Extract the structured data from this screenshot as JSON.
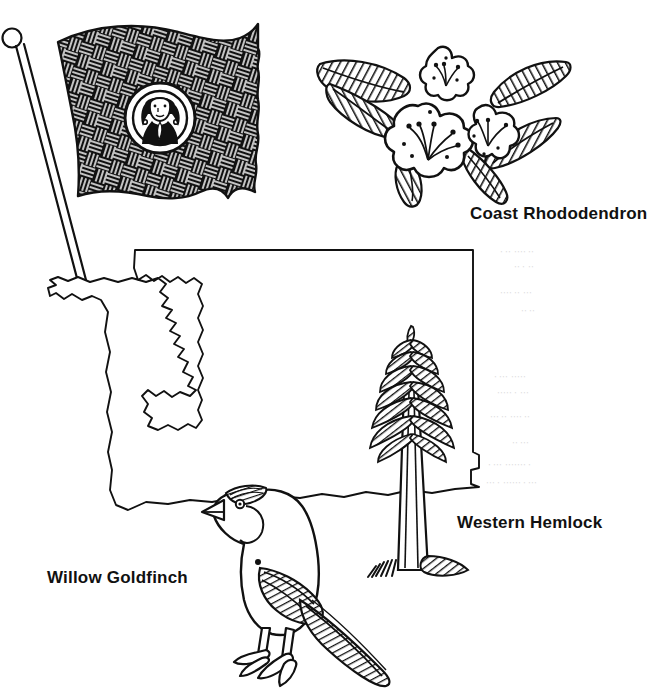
{
  "page": {
    "background_color": "#ffffff",
    "ink_color": "#111111",
    "width": 640,
    "height": 699,
    "style": "black-and-white line art / coloring book page"
  },
  "labels": {
    "rhododendron": "Coast Rhododendron",
    "hemlock": "Western Hemlock",
    "goldfinch": "Willow Goldfinch"
  },
  "illustrations": [
    {
      "name": "state-flag",
      "description": "Waving state flag on a pole with ball finial, dark cross-hatched field and a circular seal bearing a portrait of George Washington",
      "position": "top-left",
      "seal_subject": "George Washington portrait"
    },
    {
      "name": "coast-rhododendron",
      "description": "Three star-shaped rhododendron blossoms with stamens, surrounded by four long hatch-shaded leaves",
      "position": "top-right",
      "label": "Coast Rhododendron"
    },
    {
      "name": "state-map-outline",
      "description": "Outline map of Washington State with Puget Sound inlet and Olympic Peninsula on the west, straight northern border, and Columbia River jog at the southeast",
      "position": "center",
      "state": "Washington"
    },
    {
      "name": "western-hemlock-tree",
      "description": "Conifer tree with drooping hatched boughs, tall straight trunk and hatched ground at the base",
      "position": "center-right",
      "label": "Western Hemlock"
    },
    {
      "name": "willow-goldfinch-bird",
      "description": "Perching finch facing left with conical beak, dark crown, hatched wing and long pointed tail, standing on two legs",
      "position": "bottom-center",
      "label": "Willow Goldfinch"
    }
  ],
  "ghost_text": {
    "note": "faint illegible bleed-through marks from the reverse side of the page",
    "marks": [
      "· ·· ···",
      "·· · ···",
      "···· ··· ··",
      "·· ··",
      "· ··· ·····",
      "··· ·· ···· ··"
    ]
  }
}
